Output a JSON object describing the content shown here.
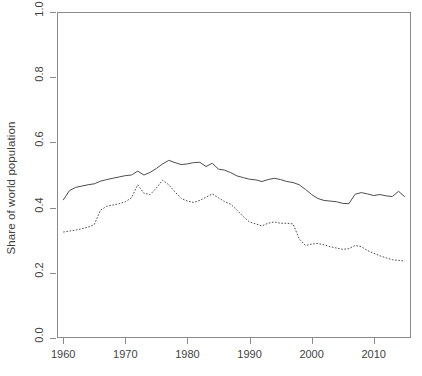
{
  "chart_data": {
    "type": "line",
    "title": "",
    "subtitle": "",
    "xlabel": "",
    "ylabel": "Share of world population",
    "xlim": [
      1959,
      2016
    ],
    "ylim": [
      0.0,
      1.0
    ],
    "grid": false,
    "legend": "none",
    "x_ticks": [
      "1960",
      "1970",
      "1980",
      "1990",
      "2000",
      "2010"
    ],
    "x_tick_values": [
      1960,
      1970,
      1980,
      1990,
      2000,
      2010
    ],
    "y_ticks": [
      "0.0",
      "0.2",
      "0.4",
      "0.6",
      "0.8",
      "1.0"
    ],
    "y_tick_values": [
      0.0,
      0.2,
      0.4,
      0.6,
      0.8,
      1.0
    ],
    "x": [
      1960,
      1961,
      1962,
      1963,
      1964,
      1965,
      1966,
      1967,
      1968,
      1969,
      1970,
      1971,
      1972,
      1973,
      1974,
      1975,
      1976,
      1977,
      1978,
      1979,
      1980,
      1981,
      1982,
      1983,
      1984,
      1985,
      1986,
      1987,
      1988,
      1989,
      1990,
      1991,
      1992,
      1993,
      1994,
      1995,
      1996,
      1997,
      1998,
      1999,
      2000,
      2001,
      2002,
      2003,
      2004,
      2005,
      2006,
      2007,
      2008,
      2009,
      2010,
      2011,
      2012,
      2013,
      2014,
      2015
    ],
    "series": [
      {
        "name": "solid-series",
        "style": "solid",
        "color": "#4d4d4d",
        "values": [
          0.423,
          0.452,
          0.462,
          0.466,
          0.47,
          0.473,
          0.481,
          0.486,
          0.49,
          0.494,
          0.498,
          0.5,
          0.512,
          0.5,
          0.508,
          0.52,
          0.534,
          0.545,
          0.538,
          0.532,
          0.534,
          0.538,
          0.539,
          0.526,
          0.536,
          0.518,
          0.515,
          0.507,
          0.497,
          0.492,
          0.487,
          0.485,
          0.48,
          0.486,
          0.49,
          0.486,
          0.48,
          0.477,
          0.47,
          0.456,
          0.44,
          0.428,
          0.422,
          0.42,
          0.418,
          0.413,
          0.412,
          0.441,
          0.446,
          0.442,
          0.437,
          0.44,
          0.436,
          0.434,
          0.45,
          0.433
        ]
      },
      {
        "name": "dotted-series",
        "style": "dotted",
        "color": "#4d4d4d",
        "values": [
          0.325,
          0.328,
          0.331,
          0.335,
          0.34,
          0.348,
          0.392,
          0.404,
          0.408,
          0.412,
          0.418,
          0.43,
          0.47,
          0.444,
          0.44,
          0.46,
          0.484,
          0.47,
          0.448,
          0.428,
          0.42,
          0.416,
          0.422,
          0.432,
          0.442,
          0.43,
          0.418,
          0.41,
          0.392,
          0.372,
          0.356,
          0.35,
          0.344,
          0.352,
          0.356,
          0.352,
          0.352,
          0.35,
          0.304,
          0.284,
          0.288,
          0.29,
          0.286,
          0.28,
          0.276,
          0.272,
          0.274,
          0.284,
          0.28,
          0.268,
          0.26,
          0.252,
          0.246,
          0.24,
          0.238,
          0.236
        ]
      }
    ]
  },
  "axes": {
    "y_title": "Share of world population"
  }
}
